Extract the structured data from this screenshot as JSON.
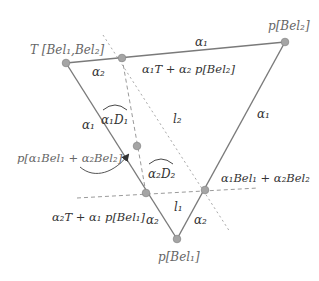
{
  "diagram": {
    "colors": {
      "edge": "#7a7a7a",
      "point": "#a5a5a5",
      "text": "#333333",
      "vertex_label": "#666666"
    },
    "vertices": {
      "T": {
        "label": "T [Bel₁,Bel₂]"
      },
      "pBel2": {
        "label": "p[Bel₂]"
      },
      "pBel1": {
        "label": "p[Bel₁]"
      }
    },
    "points": {
      "top_intersection": {
        "label": "α₁T + α₂ p[Bel₂]"
      },
      "left_intersection": {
        "label": "α₂T + α₁ p[Bel₁]"
      },
      "right_intersection": {
        "label": "α₁Bel₁ + α₂Bel₂"
      },
      "inner_point": {
        "label": "p[α₁Bel₁ + α₂Bel₂]"
      }
    },
    "edge_labels": {
      "top_left_segment": "α₂",
      "top_right_segment": "α₁",
      "left_upper_segment": "α₁",
      "left_lower_segment": "α₂",
      "right_upper_segment": "α₁",
      "right_lower_segment": "α₂"
    },
    "angle_labels": {
      "d1": "α₁D₁",
      "d2": "α₂D₂"
    },
    "line_labels": {
      "l1": "l₁",
      "l2": "l₂"
    }
  }
}
